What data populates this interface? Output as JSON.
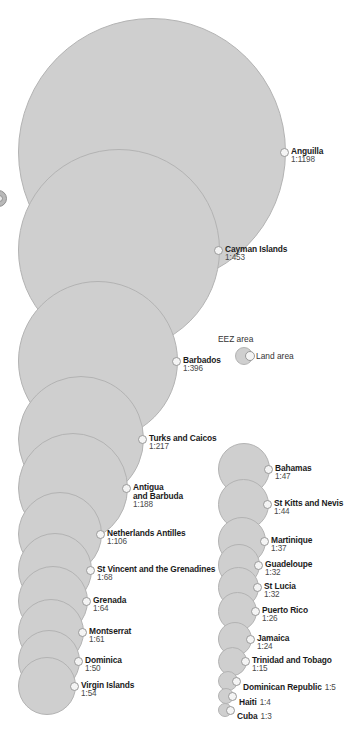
{
  "legend": {
    "eez_label": "EEZ area",
    "land_label": "Land area"
  },
  "chart_data": {
    "type": "bubble",
    "title": "",
    "subtitle": "",
    "xlabel": "",
    "ylabel": "",
    "legend_position": "center-right",
    "grid": false,
    "value_label": "EEZ area to land area ratio",
    "columns": [
      {
        "name": "left-column",
        "items": [
          {
            "name": "Anguilla",
            "ratio": "1:1198",
            "value": 1198
          },
          {
            "name": "Cayman Islands",
            "ratio": "1:453",
            "value": 453
          },
          {
            "name": "Barbados",
            "ratio": "1:396",
            "value": 396
          },
          {
            "name": "Turks and Caicos",
            "ratio": "1:217",
            "value": 217
          },
          {
            "name": "Antigua",
            "name2": "and Barbuda",
            "ratio": "1:188",
            "value": 188
          },
          {
            "name": "Netherlands Antilles",
            "ratio": "1:106",
            "value": 106
          },
          {
            "name": "St Vincent and the Grenadines",
            "ratio": "1:68",
            "value": 68
          },
          {
            "name": "Grenada",
            "ratio": "1:64",
            "value": 64
          },
          {
            "name": "Montserrat",
            "ratio": "1:61",
            "value": 61
          },
          {
            "name": "Dominica",
            "ratio": "1:50",
            "value": 50
          },
          {
            "name": "Virgin Islands",
            "ratio": "1:54",
            "value": 54
          }
        ]
      },
      {
        "name": "right-column",
        "items": [
          {
            "name": "Bahamas",
            "ratio": "1:47",
            "value": 47
          },
          {
            "name": "St Kitts and Nevis",
            "ratio": "1:44",
            "value": 44
          },
          {
            "name": "Martinique",
            "ratio": "1:37",
            "value": 37
          },
          {
            "name": "Guadeloupe",
            "ratio": "1:32",
            "value": 32
          },
          {
            "name": "St Lucia",
            "ratio": "1:32",
            "value": 32
          },
          {
            "name": "Puerto Rico",
            "ratio": "1:26",
            "value": 26
          },
          {
            "name": "Jamaica",
            "ratio": "1:24",
            "value": 24
          },
          {
            "name": "Trinidad and Tobago",
            "ratio": "1:15",
            "value": 15
          },
          {
            "name": "Dominican Republic",
            "ratio": "1:5",
            "value": 5,
            "inline": true
          },
          {
            "name": "Haiti",
            "ratio": "1:4",
            "value": 4,
            "inline": true
          },
          {
            "name": "Cuba",
            "ratio": "1:3",
            "value": 3,
            "inline": true
          }
        ]
      }
    ]
  },
  "colors": {
    "bubble_fill": "#cfcfcf",
    "bubble_stroke": "#b3b3b3",
    "marker_fill": "#f4f4f4",
    "marker_stroke": "#9a9a9a",
    "text": "#1b1b1b",
    "ratio_text": "#4a4a4a",
    "background": "#ffffff"
  },
  "geometry": {
    "left_column": {
      "left_x": 18,
      "bubbles": [
        {
          "cy": 152,
          "r": 134
        },
        {
          "cy": 250,
          "r": 101
        },
        {
          "cy": 361,
          "r": 80
        },
        {
          "cy": 439,
          "r": 63
        },
        {
          "cy": 488,
          "r": 55
        },
        {
          "cy": 534,
          "r": 42
        },
        {
          "cy": 570,
          "r": 37
        },
        {
          "cy": 601,
          "r": 35
        },
        {
          "cy": 632,
          "r": 33
        },
        {
          "cy": 661,
          "r": 31
        },
        {
          "cy": 686,
          "r": 29
        }
      ]
    },
    "right_column": {
      "left_x": 218,
      "bubbles": [
        {
          "cy": 469,
          "r": 26
        },
        {
          "cy": 504,
          "r": 25.5
        },
        {
          "cy": 541,
          "r": 24
        },
        {
          "cy": 565,
          "r": 21
        },
        {
          "cy": 587,
          "r": 20.5
        },
        {
          "cy": 611,
          "r": 19.5
        },
        {
          "cy": 639,
          "r": 17
        },
        {
          "cy": 661,
          "r": 14.5
        },
        {
          "cy": 681,
          "r": 10
        },
        {
          "cy": 696,
          "r": 8
        },
        {
          "cy": 710,
          "r": 7
        }
      ]
    }
  }
}
